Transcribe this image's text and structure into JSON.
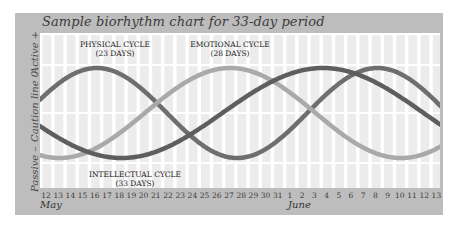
{
  "chart_data": {
    "type": "line",
    "title": "Sample biorhythm chart for 33-day period",
    "xlabel": "",
    "ylabel": "",
    "y_axis_labels": [
      "Active +",
      "Caution line 0",
      "Passive –"
    ],
    "ylim": [
      -1,
      1
    ],
    "grid": true,
    "x": [
      "12",
      "13",
      "14",
      "15",
      "16",
      "17",
      "18",
      "19",
      "20",
      "21",
      "22",
      "23",
      "24",
      "25",
      "26",
      "27",
      "28",
      "29",
      "30",
      "31",
      "1",
      "2",
      "3",
      "4",
      "5",
      "6",
      "7",
      "8",
      "9",
      "10",
      "11",
      "12",
      "13"
    ],
    "x_month_labels": [
      {
        "label": "May",
        "at": "12"
      },
      {
        "label": "June",
        "at": "1"
      }
    ],
    "series": [
      {
        "name": "PHYSICAL CYCLE (23 DAYS)",
        "period_days": 23,
        "color": "#6e6e6e",
        "values": [
          0.42,
          0.73,
          0.94,
          1.0,
          0.89,
          0.63,
          0.27,
          -0.14,
          -0.52,
          -0.82,
          -0.98,
          -0.98,
          -0.82,
          -0.52,
          -0.14,
          0.27,
          0.63,
          0.89,
          1.0,
          0.94,
          0.73,
          0.42,
          0.07,
          -0.33,
          -0.68,
          -0.92,
          -1.0,
          -0.92,
          -0.68,
          -0.33,
          0.07,
          0.46,
          0.79
        ]
      },
      {
        "name": "EMOTIONAL CYCLE (28 DAYS)",
        "period_days": 28,
        "color": "#a9a9a9",
        "values": [
          -0.97,
          -1.0,
          -0.97,
          -0.9,
          -0.78,
          -0.62,
          -0.43,
          -0.22,
          0.0,
          0.22,
          0.43,
          0.62,
          0.78,
          0.9,
          0.97,
          1.0,
          0.97,
          0.9,
          0.78,
          0.62,
          0.43,
          0.22,
          0.0,
          -0.22,
          -0.43,
          -0.62,
          -0.78,
          -0.9,
          -0.97,
          -1.0,
          -0.97,
          -0.9,
          -0.78
        ]
      },
      {
        "name": "INTELLECTUAL CYCLE (33 DAYS)",
        "period_days": 33,
        "color": "#5e5e5e",
        "values": [
          -0.38,
          -0.55,
          -0.7,
          -0.83,
          -0.92,
          -0.98,
          -1.0,
          -0.98,
          -0.92,
          -0.83,
          -0.7,
          -0.55,
          -0.38,
          -0.19,
          0.0,
          0.19,
          0.38,
          0.55,
          0.7,
          0.83,
          0.92,
          0.98,
          1.0,
          0.98,
          0.92,
          0.83,
          0.7,
          0.55,
          0.38,
          0.19,
          0.0,
          -0.19,
          -0.38
        ]
      }
    ],
    "annotations": [
      {
        "text": "PHYSICAL CYCLE",
        "sub": "(23 DAYS)"
      },
      {
        "text": "EMOTIONAL CYCLE",
        "sub": "(28 DAYS)"
      },
      {
        "text": "INTELLECTUAL CYCLE",
        "sub": "(33 DAYS)"
      }
    ],
    "legend_position": "inline annotations"
  },
  "labels": {
    "title": "Sample biorhythm chart for 33-day period",
    "active": "Active +",
    "caution": "Caution line 0",
    "passive": "Passive –",
    "physical": "PHYSICAL CYCLE",
    "physical_sub": "(23 DAYS)",
    "emotional": "EMOTIONAL CYCLE",
    "emotional_sub": "(28 DAYS)",
    "intellectual": "INTELLECTUAL CYCLE",
    "intellectual_sub": "(33 DAYS)",
    "may": "May",
    "june": "June"
  },
  "colors": {
    "panel": "#bdbdbd",
    "stripe": "#ececec",
    "guide": "#ffffff",
    "physical": "#6e6e6e",
    "emotional": "#a9a9a9",
    "intellectual": "#5e5e5e"
  }
}
